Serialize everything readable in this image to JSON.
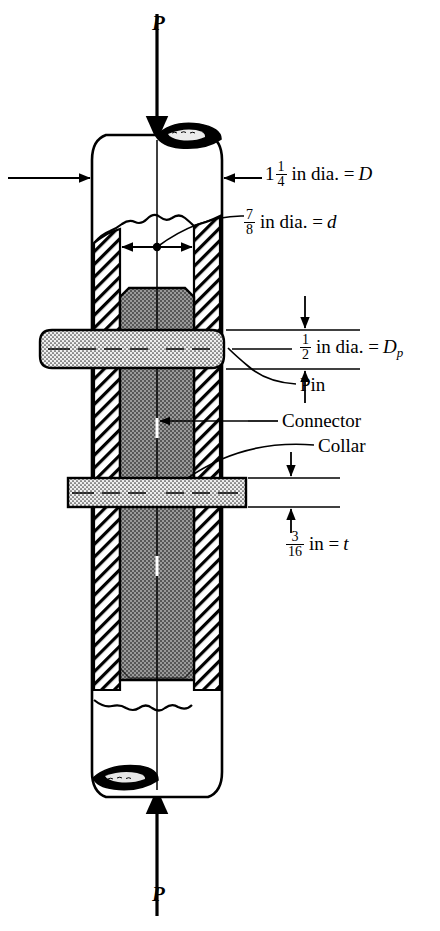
{
  "figure": {
    "type": "engineering-sectional-diagram",
    "background_color": "#ffffff",
    "line_color": "#000000",
    "hatch_color": "#000000",
    "connector_fill": "#8c8c8c",
    "pin_fill": "#e8e8e8"
  },
  "loads": {
    "top_label": "P",
    "bottom_label": "P",
    "top_arrow": "down-arrow",
    "bottom_arrow": "up-arrow"
  },
  "dimensions": [
    {
      "id": "D",
      "whole": "1",
      "num": "1",
      "den": "4",
      "unit_text": "in dia. =",
      "symbol": "D",
      "full_text": "1 1/4 in dia. = D",
      "leader": "left-arrow-to-outer-wall"
    },
    {
      "id": "d",
      "whole": "",
      "num": "7",
      "den": "8",
      "unit_text": "in dia. =",
      "symbol": "d",
      "full_text": "7/8 in dia. = d",
      "leader": "curved-leader-to-inner-bore"
    },
    {
      "id": "Dp",
      "whole": "",
      "num": "1",
      "den": "2",
      "unit_text": "in dia. =",
      "symbol": "D",
      "subscript": "p",
      "full_text": "1/2 in dia. = Dp",
      "leader": "horizontal-leader-to-pin"
    },
    {
      "id": "t",
      "whole": "",
      "num": "3",
      "den": "16",
      "unit_text": "in =",
      "symbol": "t",
      "full_text": "3/16 in = t",
      "leader": "vertical-dimension-arrows-collar-thickness"
    }
  ],
  "callouts": [
    {
      "id": "pin",
      "label": "Pin",
      "leader": "curved-leader-to-pin"
    },
    {
      "id": "connector",
      "label": "Connector",
      "leader": "straight-leader-to-connector-core"
    },
    {
      "id": "collar",
      "label": "Collar",
      "leader": "curved-leader-to-collar"
    }
  ]
}
